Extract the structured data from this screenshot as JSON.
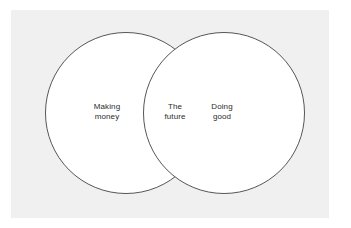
{
  "figure": {
    "type": "venn-diagram",
    "title": "",
    "background_color": "#ffffff",
    "panel_color": "#f0f0f0",
    "stroke_color": "#565656",
    "text_color": "#2b2b2b",
    "circle_fill": "#ffffff"
  },
  "chart_data": {
    "type": "diagram",
    "diagram_type": "venn",
    "title": "",
    "sets": [
      {
        "id": "left",
        "label_lines": [
          "Making",
          "money"
        ],
        "label": "Making money",
        "cx": 126,
        "cy": 113,
        "r": 80.5
      },
      {
        "id": "right",
        "label_lines": [
          "Doing",
          "good"
        ],
        "label": "Doing good",
        "cx": 224,
        "cy": 113,
        "r": 80.5
      }
    ],
    "intersection": {
      "id": "both",
      "label_lines": [
        "The",
        "future"
      ],
      "label": "The future"
    },
    "legend": null,
    "grid": false
  },
  "labels": {
    "left": {
      "line1": "Making",
      "line2": "money"
    },
    "center": {
      "line1": "The",
      "line2": "future"
    },
    "right": {
      "line1": "Doing",
      "line2": "good"
    }
  }
}
